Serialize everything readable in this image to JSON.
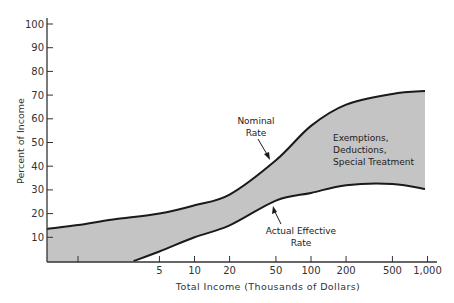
{
  "chart_data": {
    "type": "area",
    "title": "",
    "xlabel": "Total Income (Thousands of Dollars)",
    "ylabel": "Percent of Income",
    "x_scale": "log",
    "x_ticks": [
      1,
      5,
      10,
      20,
      50,
      100,
      200,
      500,
      1000
    ],
    "x_tick_labels": [
      "",
      "5",
      "10",
      "20",
      "50",
      "100",
      "200",
      "500",
      "1,000"
    ],
    "y_ticks": [
      10,
      20,
      30,
      40,
      50,
      60,
      70,
      80,
      90,
      100
    ],
    "y_tick_labels": [
      "10",
      "20",
      "30",
      "40",
      "50",
      "60",
      "70",
      "80",
      "90",
      "100"
    ],
    "ylim": [
      0,
      100
    ],
    "xlim": [
      0.4,
      1300
    ],
    "grid": false,
    "series": [
      {
        "name": "Nominal Rate",
        "x": [
          0.4,
          1,
          2,
          5,
          10,
          20,
          50,
          100,
          200,
          500,
          1000
        ],
        "values": [
          13.5,
          15.2,
          17.5,
          20.0,
          23.5,
          28.0,
          42.5,
          57.0,
          66.0,
          70.5,
          71.7
        ]
      },
      {
        "name": "Actual Effective Rate",
        "x": [
          3,
          5,
          10,
          20,
          50,
          100,
          200,
          500,
          1000
        ],
        "values": [
          0,
          4.0,
          10.0,
          15.0,
          25.5,
          28.7,
          32.0,
          32.5,
          30.4
        ]
      }
    ],
    "shaded_region": "between Nominal Rate and Actual Effective Rate (Exemptions, Deductions, Special Treatment)",
    "annotations": [
      {
        "text": [
          "Nominal",
          "Rate"
        ],
        "points_to": "Nominal Rate"
      },
      {
        "text": [
          "Actual Effective",
          "Rate"
        ],
        "points_to": "Actual Effective Rate"
      },
      {
        "text": [
          "Exemptions,",
          "Deductions,",
          "Special Treatment"
        ],
        "region": "shaded"
      }
    ]
  },
  "labels": {
    "ylabel": "Percent of Income",
    "xlabel": "Total Income (Thousands of Dollars)",
    "nominal_1": "Nominal",
    "nominal_2": "Rate",
    "effective_1": "Actual Effective",
    "effective_2": "Rate",
    "region_1": "Exemptions,",
    "region_2": "Deductions,",
    "region_3": "Special Treatment"
  },
  "colors": {
    "fill": "#c4c4c4",
    "line": "#1a1a1a",
    "axis": "#333333"
  }
}
